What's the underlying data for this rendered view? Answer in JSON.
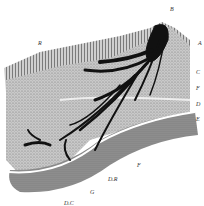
{
  "figure": {
    "labels": [
      {
        "id": "B",
        "text": "B",
        "x": 170,
        "y": 6
      },
      {
        "id": "R",
        "text": "R",
        "x": 38,
        "y": 40
      },
      {
        "id": "A",
        "text": "A",
        "x": 198,
        "y": 40
      },
      {
        "id": "C",
        "text": "C",
        "x": 196,
        "y": 69
      },
      {
        "id": "F_upper",
        "text": "F",
        "x": 196,
        "y": 85
      },
      {
        "id": "D",
        "text": "D",
        "x": 196,
        "y": 101
      },
      {
        "id": "E",
        "text": "E",
        "x": 196,
        "y": 116
      },
      {
        "id": "F",
        "text": "F",
        "x": 137,
        "y": 162
      },
      {
        "id": "DR",
        "text": "D.R",
        "x": 108,
        "y": 176
      },
      {
        "id": "G",
        "text": "G",
        "x": 90,
        "y": 189
      },
      {
        "id": "DC",
        "text": "D.C",
        "x": 64,
        "y": 200
      }
    ]
  }
}
